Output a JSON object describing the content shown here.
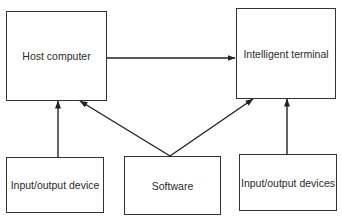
{
  "diagram": {
    "type": "block-diagram",
    "nodes": [
      {
        "id": "host",
        "label": "Host computer"
      },
      {
        "id": "terminal",
        "label": "Intelligent terminal"
      },
      {
        "id": "io_left",
        "label": "Input/output device"
      },
      {
        "id": "software",
        "label": "Software"
      },
      {
        "id": "io_right",
        "label": "Input/output devices"
      }
    ],
    "edges": [
      {
        "from": "host",
        "to": "terminal"
      },
      {
        "from": "io_left",
        "to": "host"
      },
      {
        "from": "software",
        "to": "host"
      },
      {
        "from": "software",
        "to": "terminal"
      },
      {
        "from": "io_right",
        "to": "terminal"
      }
    ],
    "colors": {
      "line": "#222222",
      "box_border": "#333333",
      "background": "#ffffff"
    }
  }
}
